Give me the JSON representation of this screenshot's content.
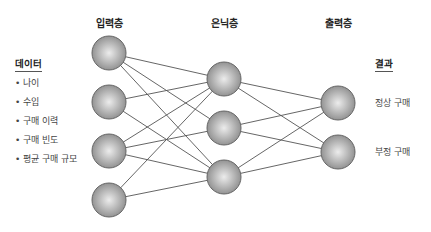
{
  "layers": {
    "input": {
      "title": "입력층",
      "x": 109,
      "nodes_y": [
        53,
        102,
        151,
        200
      ]
    },
    "hidden": {
      "title": "은닉층",
      "x": 224,
      "nodes_y": [
        79,
        128,
        177
      ]
    },
    "output": {
      "title": "출력층",
      "x": 338,
      "nodes_y": [
        103,
        152
      ]
    }
  },
  "node_radius": 17,
  "connections": {
    "input_to_hidden": [
      [
        0,
        0
      ],
      [
        0,
        1
      ],
      [
        0,
        2
      ],
      [
        1,
        0
      ],
      [
        1,
        2
      ],
      [
        2,
        0
      ],
      [
        2,
        1
      ],
      [
        2,
        2
      ],
      [
        3,
        0
      ],
      [
        3,
        2
      ]
    ],
    "hidden_to_output": [
      [
        0,
        0
      ],
      [
        0,
        1
      ],
      [
        1,
        0
      ],
      [
        1,
        1
      ],
      [
        2,
        0
      ],
      [
        2,
        1
      ]
    ]
  },
  "data_panel": {
    "title": "데이터",
    "items": [
      "나이",
      "수입",
      "구매 이력",
      "구매 빈도",
      "평균 구매 규모"
    ]
  },
  "result_panel": {
    "title": "결과",
    "items": [
      "정상 구매",
      "부정 구매"
    ]
  },
  "colors": {
    "node_light": "#e6e6e6",
    "node_dark": "#8c8c8c",
    "node_stroke": "#666666",
    "edge": "#555555"
  }
}
